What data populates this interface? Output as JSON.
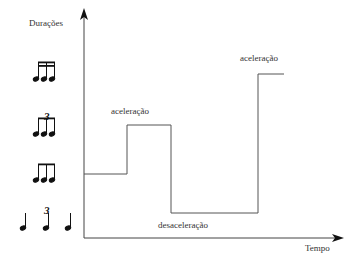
{
  "diagram": {
    "y_axis_label": "Durações",
    "x_axis_label": "Tempo",
    "annotations": {
      "first_acceleration": "aceleração",
      "deceleration": "desaceleração",
      "second_acceleration": "aceleração"
    },
    "duration_levels": [
      {
        "name": "sixteenth-notes-group",
        "description": "four-beamed group of three sixteenth notes (semicolcheias)"
      },
      {
        "name": "eighth-note-triplet",
        "description": "three beamed eighth notes with triplet 3"
      },
      {
        "name": "eighth-notes-group",
        "description": "three beamed eighth notes (colcheias)"
      },
      {
        "name": "quarter-note-triplet",
        "description": "three quarter notes with triplet 3"
      }
    ],
    "step_path": [
      {
        "x": 84,
        "y": 174
      },
      {
        "x": 127,
        "y": 174
      },
      {
        "x": 127,
        "y": 125
      },
      {
        "x": 171,
        "y": 125
      },
      {
        "x": 171,
        "y": 213
      },
      {
        "x": 258,
        "y": 213
      },
      {
        "x": 258,
        "y": 74
      },
      {
        "x": 284,
        "y": 74
      }
    ],
    "colors": {
      "line": "#555555",
      "axis": "#444444",
      "notes": "#111111"
    }
  }
}
